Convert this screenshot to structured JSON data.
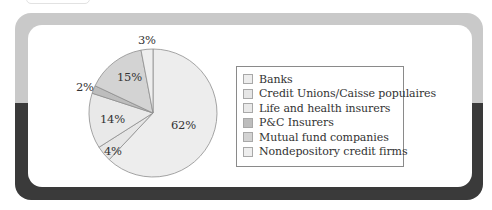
{
  "chart_data": {
    "type": "pie",
    "title": "",
    "categories": [
      "Banks",
      "Credit Unions/Caisse populaires",
      "Life and health insurers",
      "P&C Insurers",
      "Mutual fund companies",
      "Nondepository credit firms"
    ],
    "values": [
      62,
      4,
      14,
      2,
      15,
      3
    ],
    "labels": [
      "62%",
      "4%",
      "14%",
      "2%",
      "15%",
      "3%"
    ],
    "colors": [
      "#ededed",
      "#e6e6e6",
      "#e9e9e9",
      "#bdbdbd",
      "#d3d3d3",
      "#eeeeee"
    ],
    "start_angle": "12 o'clock",
    "direction": "clockwise",
    "legend_position": "right"
  },
  "legend": {
    "items": [
      {
        "label": "Banks",
        "color": "#ededed"
      },
      {
        "label": "Credit Unions/Caisse populaires",
        "color": "#e6e6e6"
      },
      {
        "label": "Life and health insurers",
        "color": "#e9e9e9"
      },
      {
        "label": "P&C Insurers",
        "color": "#bdbdbd"
      },
      {
        "label": "Mutual fund companies",
        "color": "#d3d3d3"
      },
      {
        "label": "Nondepository credit firms",
        "color": "#eeeeee"
      }
    ]
  },
  "slice_labels": {
    "banks": "62%",
    "credit_unions": "4%",
    "life_health": "14%",
    "pc": "2%",
    "mutual": "15%",
    "nondepository": "3%"
  }
}
